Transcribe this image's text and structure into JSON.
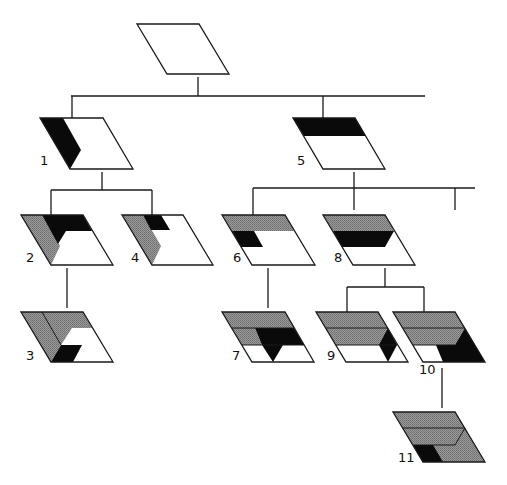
{
  "diagram": {
    "colors": {
      "line": "#1a1a1a",
      "black": "#0a0a0a",
      "gray": "#8c8c8c",
      "white": "#ffffff"
    },
    "nodes": [
      {
        "id": "root",
        "label": ""
      },
      {
        "id": "1",
        "label": "1"
      },
      {
        "id": "2",
        "label": "2"
      },
      {
        "id": "3",
        "label": "3"
      },
      {
        "id": "4",
        "label": "4"
      },
      {
        "id": "5",
        "label": "5"
      },
      {
        "id": "6",
        "label": "6"
      },
      {
        "id": "7",
        "label": "7"
      },
      {
        "id": "8",
        "label": "8"
      },
      {
        "id": "9",
        "label": "9"
      },
      {
        "id": "10",
        "label": "10"
      },
      {
        "id": "11",
        "label": "11"
      }
    ],
    "edges": [
      [
        "root",
        "1"
      ],
      [
        "root",
        "5"
      ],
      [
        "1",
        "2"
      ],
      [
        "1",
        "4"
      ],
      [
        "2",
        "3"
      ],
      [
        "5",
        "6"
      ],
      [
        "5",
        "8"
      ],
      [
        "6",
        "7"
      ],
      [
        "8",
        "9"
      ],
      [
        "8",
        "10"
      ],
      [
        "10",
        "11"
      ]
    ]
  }
}
